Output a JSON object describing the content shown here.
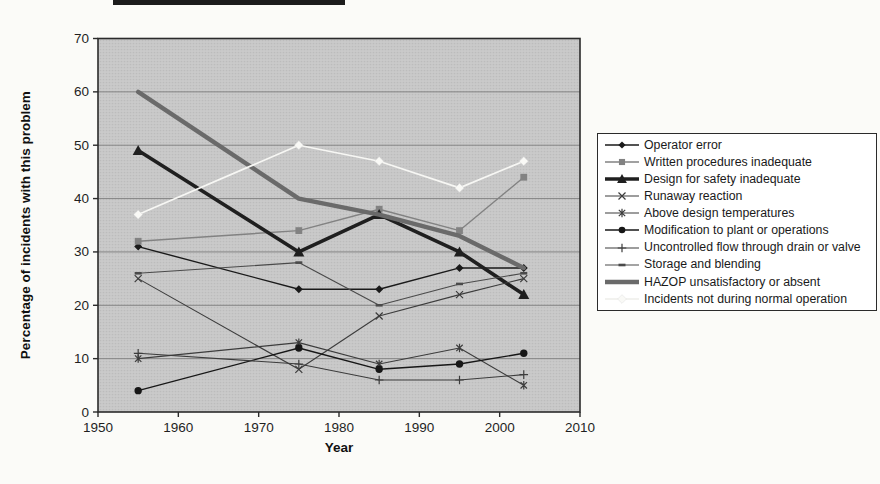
{
  "chart_data": {
    "type": "line",
    "title": "",
    "xlabel": "Year",
    "ylabel": "Percentage of incidents with this problem",
    "xlim": [
      1950,
      2010
    ],
    "ylim": [
      0,
      70
    ],
    "x_ticks": [
      1950,
      1960,
      1970,
      1980,
      1990,
      2000,
      2010
    ],
    "y_ticks": [
      0,
      10,
      20,
      30,
      40,
      50,
      60,
      70
    ],
    "grid": "horizontal",
    "legend_position": "right-outside-box",
    "x": [
      1955,
      1975,
      1985,
      1995,
      2003
    ],
    "series": [
      {
        "name": "Operator error",
        "values": [
          31,
          23,
          23,
          27,
          27
        ],
        "marker": "diamond",
        "color": "#1a1a1a",
        "width": 1.4
      },
      {
        "name": "Written procedures inadequate",
        "values": [
          32,
          34,
          38,
          34,
          44
        ],
        "marker": "square",
        "color": "#828282",
        "width": 1.4
      },
      {
        "name": "Design for safety inadequate",
        "values": [
          49,
          30,
          37,
          30,
          22
        ],
        "marker": "triangle",
        "color": "#1f1f1f",
        "width": 3.6
      },
      {
        "name": "Runaway reaction",
        "values": [
          25,
          8,
          18,
          22,
          25
        ],
        "marker": "x",
        "color": "#3c3c3c",
        "width": 1.1
      },
      {
        "name": "Above design temperatures",
        "values": [
          10,
          13,
          9,
          12,
          5
        ],
        "marker": "asterisk",
        "color": "#3c3c3c",
        "width": 1.1
      },
      {
        "name": "Modification to plant or operations",
        "values": [
          4,
          12,
          8,
          9,
          11
        ],
        "marker": "circle",
        "color": "#171717",
        "width": 1.4
      },
      {
        "name": "Uncontrolled flow through drain or valve",
        "values": [
          11,
          9,
          6,
          6,
          7
        ],
        "marker": "plus",
        "color": "#3c3c3c",
        "width": 1.1
      },
      {
        "name": "Storage and blending",
        "values": [
          26,
          28,
          20,
          24,
          26
        ],
        "marker": "dash",
        "color": "#4a4a4a",
        "width": 1.1
      },
      {
        "name": "HAZOP unsatisfactory or absent",
        "values": [
          60,
          40,
          37,
          33,
          27
        ],
        "marker": "none",
        "color": "#6a6a6a",
        "width": 4.4
      },
      {
        "name": "Incidents not during normal operation",
        "values": [
          37,
          50,
          47,
          42,
          47
        ],
        "marker": "diamond-white",
        "color": "#f7f7f4",
        "width": 1.7
      }
    ],
    "colors": {
      "plot_background": "#cacaca",
      "halftone_dot": "#bcbcbc",
      "gridline": "#7d7d7d",
      "axis": "#2b2b2b",
      "page_background": "#fbfbf8",
      "legend_background": "#ffffff",
      "legend_border": "#2b2b2b"
    }
  }
}
